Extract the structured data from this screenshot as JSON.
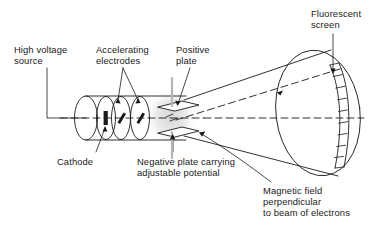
{
  "figure": {
    "type": "schematic-diagram",
    "background_color": "#ffffff",
    "line_color": "#1a1a1a"
  },
  "labels": {
    "high_voltage_source": "High voltage\nsource",
    "accelerating_electrodes": "Accelerating\nelectrodes",
    "positive_plate": "Positive\nplate",
    "fluorescent_screen": "Fluorescent\nscreen",
    "cathode": "Cathode",
    "negative_plate": "Negative plate carrying\nadjustable potential",
    "magnetic_field": "Magnetic field\nperpendicular\nto beam of electrons"
  },
  "components": {
    "tube_body": "electron-gun-cylinder",
    "electrode_discs": 2,
    "deflection_plates": 2,
    "screen_segments": 9,
    "beam_paths": 2,
    "beam_style": "dashed"
  }
}
